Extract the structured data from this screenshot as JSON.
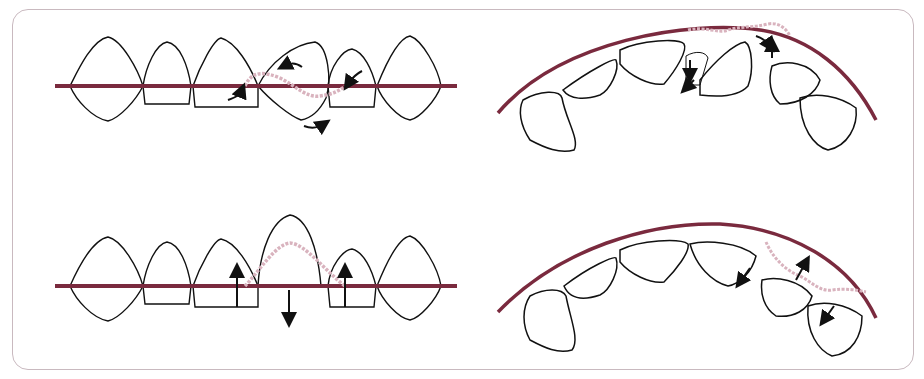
{
  "figure": {
    "colors": {
      "archwire": "#7a2a3e",
      "wire_engaged": "#d9b3be",
      "tooth_outline": "#111111",
      "frame_border": "#c9b9bf",
      "arrow": "#111111"
    },
    "panels": [
      {
        "id": "top-left",
        "view": "frontal",
        "teeth": 7,
        "arrows": 4
      },
      {
        "id": "top-right",
        "view": "occlusal-arch",
        "teeth": 7,
        "arrows": 4
      },
      {
        "id": "bottom-left",
        "view": "frontal",
        "teeth": 7,
        "arrows": 3
      },
      {
        "id": "bottom-right",
        "view": "occlusal-arch",
        "teeth": 7,
        "arrows": 3
      }
    ]
  }
}
